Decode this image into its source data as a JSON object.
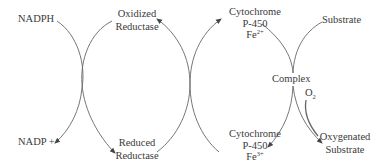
{
  "diagram": {
    "type": "cytochrome-p450-reaction-cycle",
    "line_color": "#555555",
    "text_color": "#3a3a3a",
    "labels": {
      "nadph": "NADPH",
      "nadp_plus": "NADP +",
      "oxidized_reductase": [
        "Oxidized",
        "Reductase"
      ],
      "reduced_reductase": [
        "Reduced",
        "Reductase"
      ],
      "cytochrome_fe2": {
        "line1": "Cytochrome",
        "line2": "P-450",
        "fe": "Fe",
        "charge": "2+"
      },
      "cytochrome_fe3": {
        "line1": "Cytochrome",
        "line2": "P-450",
        "fe": "Fe",
        "charge": "3+"
      },
      "substrate": "Substrate",
      "complex": "Complex",
      "o2": {
        "symbol": "O",
        "sub": "2"
      },
      "oxygenated_substrate": [
        "Oxygenated",
        "Substrate"
      ]
    },
    "edges": [
      {
        "from": "NADPH",
        "to": "NADP +"
      },
      {
        "from": "Oxidized Reductase",
        "to": "Reduced Reductase"
      },
      {
        "from": "Reduced Reductase",
        "to": "Oxidized Reductase"
      },
      {
        "from": "Cytochrome P-450 Fe3+",
        "to": "Cytochrome P-450 Fe2+"
      },
      {
        "from": "Cytochrome P-450 Fe2+",
        "to": "Complex"
      },
      {
        "from": "Substrate",
        "to": "Complex"
      },
      {
        "from": "Complex",
        "to": "Cytochrome P-450 Fe3+"
      },
      {
        "from": "Complex",
        "to": "Oxygenated Substrate"
      },
      {
        "from": "O2",
        "to": "Oxygenated Substrate"
      }
    ]
  }
}
